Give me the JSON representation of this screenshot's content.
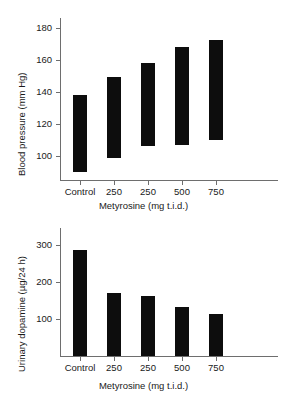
{
  "figure": {
    "background_color": "#ffffff",
    "bar_color": "#0d0d0d",
    "axis_color": "#6e6e6e"
  },
  "chart_data": [
    {
      "type": "bar",
      "subtype": "floating-range-bar",
      "panel_name": "blood-pressure",
      "title": "",
      "xlabel": "Metyrosine (mg t.i.d.)",
      "ylabel": "Blood pressure (mm Hg)",
      "categories": [
        "Control",
        "250",
        "250",
        "500",
        "750"
      ],
      "yticks": [
        100,
        120,
        140,
        160,
        180
      ],
      "ylim": [
        85,
        186
      ],
      "grid": false,
      "legend": null,
      "series": [
        {
          "name": "diastolic (bar bottom)",
          "values": [
            90,
            99,
            106,
            107,
            110
          ]
        },
        {
          "name": "systolic (bar top)",
          "values": [
            138,
            149,
            158,
            168,
            172
          ]
        }
      ],
      "bars": [
        {
          "category": "Control",
          "low": 90,
          "high": 138
        },
        {
          "category": "250",
          "low": 99,
          "high": 149
        },
        {
          "category": "250",
          "low": 106,
          "high": 158
        },
        {
          "category": "500",
          "low": 107,
          "high": 168
        },
        {
          "category": "750",
          "low": 110,
          "high": 172
        }
      ]
    },
    {
      "type": "bar",
      "subtype": "column",
      "panel_name": "urinary-dopamine",
      "title": "",
      "xlabel": "Metyrosine (mg t.i.d.)",
      "ylabel": "Urinary dopamine (µg/24 h)",
      "categories": [
        "Control",
        "250",
        "250",
        "500",
        "750"
      ],
      "yticks": [
        100,
        200,
        300
      ],
      "ylim": [
        0,
        345
      ],
      "grid": false,
      "legend": null,
      "values": [
        285,
        170,
        163,
        132,
        113
      ]
    }
  ]
}
